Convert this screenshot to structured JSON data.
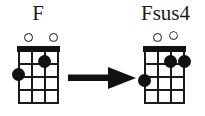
{
  "instrument": "ukulele",
  "colors": {
    "background": "#ffffff",
    "ink": "#111111",
    "label": "#1a1a1a"
  },
  "diagrams": [
    {
      "id": "f",
      "name": "F",
      "label": "F",
      "strings": 4,
      "frets": 4,
      "nut": true,
      "open_strings": [
        {
          "string": 3,
          "symbol": "open-circle",
          "clipped": false
        },
        {
          "string": 1,
          "symbol": "open-circle",
          "clipped": false
        }
      ],
      "fingerings": [
        {
          "string": 2,
          "fret": 1
        },
        {
          "string": 4,
          "fret": 2
        }
      ]
    },
    {
      "id": "fsus4",
      "name": "Fsus4",
      "label": "Fsus4",
      "strings": 4,
      "frets": 4,
      "nut": true,
      "open_strings": [
        {
          "string": 3,
          "symbol": "open-circle",
          "clipped": false
        },
        {
          "string": 2,
          "symbol": "open-circle",
          "clipped": true
        }
      ],
      "fingerings": [
        {
          "string": 2,
          "fret": 1
        },
        {
          "string": 1,
          "fret": 1
        },
        {
          "string": 4,
          "fret": 2
        }
      ]
    }
  ],
  "arrow": {
    "direction": "right",
    "from": "F",
    "to": "Fsus4"
  }
}
